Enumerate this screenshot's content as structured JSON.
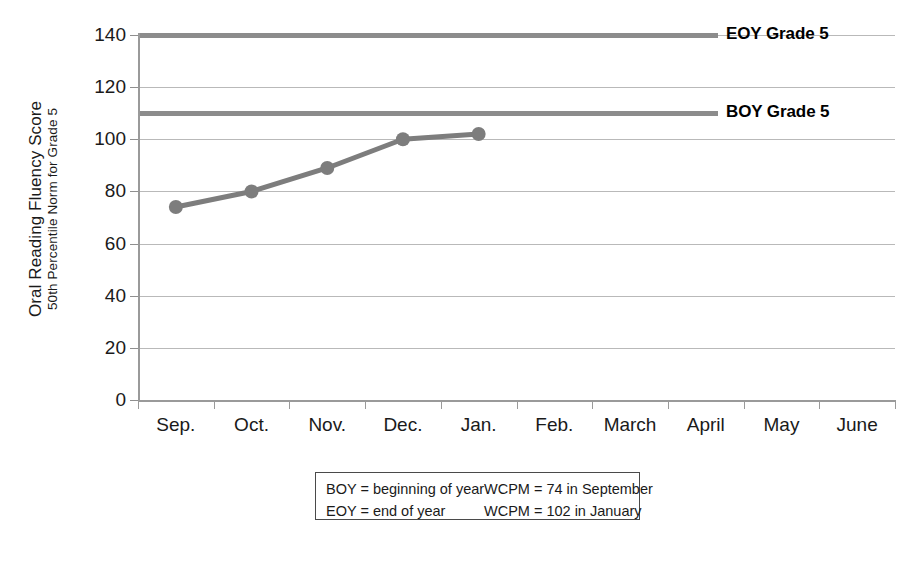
{
  "chart_data": {
    "type": "line",
    "title": "",
    "subtitle": "",
    "ylabel": "Oral Reading Fluency Score",
    "ylabel_sub": "50th Percentile Norm for Grade 5",
    "xlabel": "",
    "categories": [
      "Sep.",
      "Oct.",
      "Nov.",
      "Dec.",
      "Jan.",
      "Feb.",
      "March",
      "April",
      "May",
      "June"
    ],
    "series": [
      {
        "name": "Student ORF",
        "values": [
          74,
          80,
          89,
          100,
          102,
          null,
          null,
          null,
          null,
          null
        ],
        "color": "#7d7d7d",
        "marker": "circle"
      }
    ],
    "reference_lines": [
      {
        "label": "EOY Grade 5",
        "value": 140,
        "color": "#8c8c8c"
      },
      {
        "label": "BOY Grade 5",
        "value": 110,
        "color": "#8c8c8c"
      }
    ],
    "ylim": [
      0,
      140
    ],
    "yticks": [
      0,
      20,
      40,
      60,
      80,
      100,
      120,
      140
    ],
    "ytick_labels": [
      "0",
      "20",
      "40",
      "60",
      "80",
      "100",
      "120",
      "140"
    ],
    "grid": true,
    "grid_axis": "y",
    "legend_position": "below-plot-box"
  },
  "axis": {
    "y_title_main": "Oral Reading Fluency Score",
    "y_title_sub": "50th Percentile Norm for Grade 5",
    "y_ticks": [
      "0",
      "20",
      "40",
      "60",
      "80",
      "100",
      "120",
      "140"
    ],
    "x_ticks": [
      "Sep.",
      "Oct.",
      "Nov.",
      "Dec.",
      "Jan.",
      "Feb.",
      "March",
      "April",
      "May",
      "June"
    ]
  },
  "reference": {
    "eoy_label": "EOY Grade 5",
    "boy_label": "BOY Grade 5"
  },
  "legend": {
    "rows": [
      {
        "left": "BOY = beginning of year",
        "right": "WCPM = 74 in September"
      },
      {
        "left": "EOY = end of year",
        "right": "WCPM = 102 in January"
      }
    ]
  },
  "colors": {
    "series_line": "#7d7d7d",
    "reference_line": "#8c8c8c",
    "gridline": "#b9b9b9",
    "axis": "#9a9a9a",
    "text": "#1a1a1a"
  }
}
